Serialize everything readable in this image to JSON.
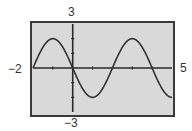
{
  "chart_data": {
    "type": "line",
    "title": "",
    "xlabel": "",
    "ylabel": "",
    "xlim": [
      -2,
      5
    ],
    "ylim": [
      -3,
      3
    ],
    "grid": false,
    "legend": null,
    "window_labels": {
      "xmin": "−2",
      "xmax": "5",
      "ymin": "−3",
      "ymax": "3"
    },
    "x_ticks": [
      -1,
      0,
      1,
      2,
      3,
      4
    ],
    "y_ticks": [
      -2,
      -1,
      1,
      2
    ],
    "series": [
      {
        "name": "y = -2 sin(pi x / 2)",
        "x": [
          -2,
          -1.5,
          -1,
          -0.5,
          0,
          0.5,
          1,
          1.5,
          2,
          2.5,
          3,
          3.5,
          4,
          4.5,
          5
        ],
        "values": [
          0,
          1.41,
          2,
          1.41,
          0,
          -1.41,
          -2,
          -1.41,
          0,
          1.41,
          2,
          1.41,
          0,
          -1.41,
          -2
        ]
      }
    ],
    "colors": {
      "background": "#d9d9d9",
      "frame": "#3a3a3a",
      "curve": "#333333",
      "axes": "#2a2a2a"
    }
  }
}
